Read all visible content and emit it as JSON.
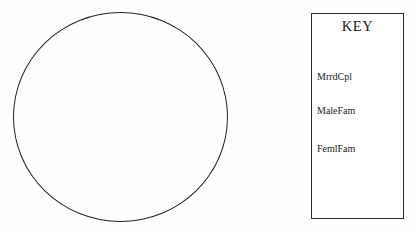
{
  "diagram": {
    "title": "",
    "circle": {
      "name": "set-circle",
      "label": "",
      "fill": "none",
      "stroke_color": "#222222"
    }
  },
  "key": {
    "title": "KEY",
    "entries": [
      {
        "label": "MrrdCpl"
      },
      {
        "label": "MaleFam"
      },
      {
        "label": "FemlFam"
      }
    ],
    "border_color": "#2a2a2a",
    "background_color": "#ffffff"
  },
  "page": {
    "background_color": "#fefefe",
    "text_color": "#1a1a1a"
  }
}
